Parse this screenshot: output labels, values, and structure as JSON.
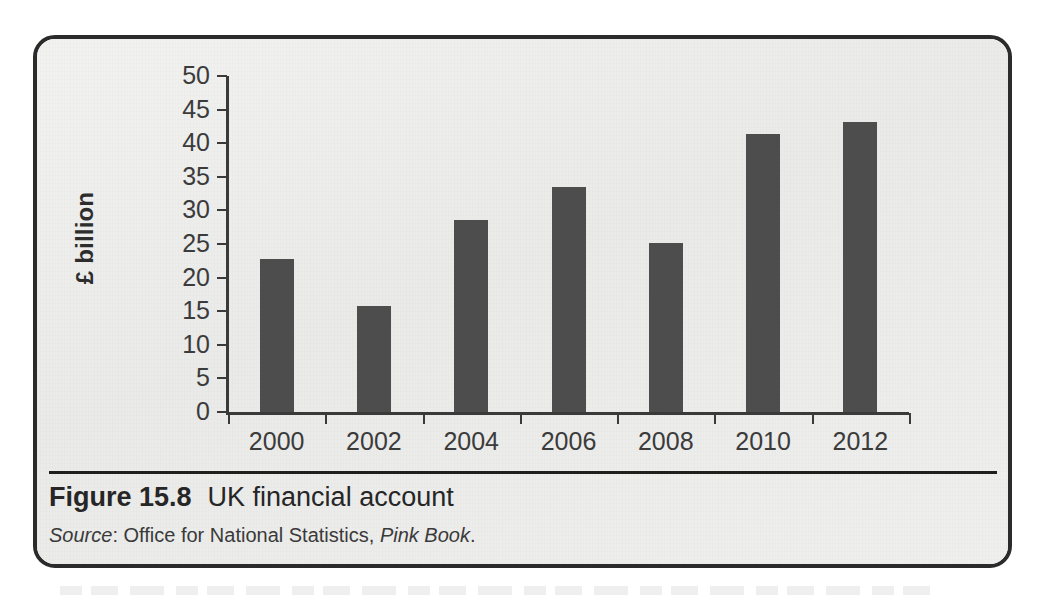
{
  "figure": {
    "number_label": "Figure 15.8",
    "title": "UK financial account",
    "source_prefix": "Source",
    "source_sep": ": ",
    "source_org": "Office for National Statistics, ",
    "source_publication": "Pink Book",
    "source_end": "."
  },
  "colors": {
    "bar": "#4d4d4d",
    "axis": "#3a3a3a",
    "frame": "#2b2b2b",
    "paper": "#ececeb",
    "text": "#3b3b3b"
  },
  "chart_data": {
    "type": "bar",
    "title": "UK financial account",
    "xlabel": "",
    "ylabel": "£ billion",
    "ylim": [
      0,
      50
    ],
    "yticks": [
      0,
      5,
      10,
      15,
      20,
      25,
      30,
      35,
      40,
      45,
      50
    ],
    "ytick_labels": [
      "0",
      "5",
      "10",
      "15",
      "20",
      "25",
      "30",
      "35",
      "40",
      "45",
      "50"
    ],
    "grid": false,
    "legend": null,
    "categories": [
      "2000",
      "2002",
      "2004",
      "2006",
      "2008",
      "2010",
      "2012"
    ],
    "values": [
      22.7,
      15.7,
      28.6,
      33.5,
      25.2,
      41.4,
      43.1
    ],
    "series": [
      {
        "name": "UK financial account",
        "values": [
          22.7,
          15.7,
          28.6,
          33.5,
          25.2,
          41.4,
          43.1
        ]
      }
    ]
  }
}
